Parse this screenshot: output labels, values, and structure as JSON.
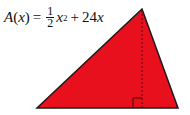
{
  "formula": {
    "lhs_func": "A",
    "lhs_var": "x",
    "equals": "=",
    "frac_num": "1",
    "frac_den": "2",
    "term1_var": "x",
    "term1_exp": "2",
    "plus": "+",
    "term2": "24",
    "term2_var": "x"
  },
  "triangle": {
    "fill": "#e8101c",
    "stroke": "#1a1a1a",
    "apex": [
      142,
      9
    ],
    "base_left": [
      37,
      108
    ],
    "base_right": [
      178,
      108
    ],
    "altitude_x": 142,
    "right_angle_marker_size": 9
  }
}
